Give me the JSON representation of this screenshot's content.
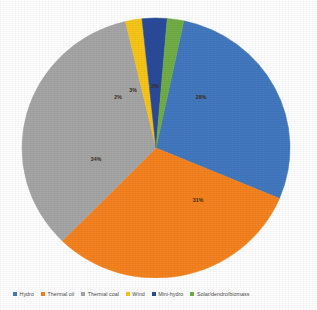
{
  "chart_data": {
    "type": "pie",
    "title": "",
    "categories": [
      "Hydro",
      "Thermal oil",
      "Thermal coal",
      "Wind",
      "Mini-hydro",
      "Solar/dendro/biomass"
    ],
    "values": [
      28,
      31,
      34,
      2,
      3,
      2
    ],
    "value_labels": [
      "28%",
      "31%",
      "34%",
      "2%",
      "3%",
      "2%"
    ],
    "colors": [
      "#4178be",
      "#f4821f",
      "#a5a5a5",
      "#f6c518",
      "#2a4b9b",
      "#71ad47"
    ],
    "legend_position": "bottom",
    "grid": false,
    "start_angle_deg": 12,
    "direction": "clockwise",
    "labels_inside": true
  },
  "legend": {
    "items": [
      {
        "label": "Hydro",
        "color": "#4178be"
      },
      {
        "label": "Thermal oil",
        "color": "#f4821f"
      },
      {
        "label": "Thermal coal",
        "color": "#a5a5a5"
      },
      {
        "label": "Wind",
        "color": "#f6c518"
      },
      {
        "label": "Mini-hydro",
        "color": "#2a4b9b"
      },
      {
        "label": "Solar/dendro/biomass",
        "color": "#71ad47"
      }
    ]
  },
  "slices": [
    {
      "name": "hydro",
      "label": "28%",
      "color": "#4178be",
      "lx": 201,
      "ly": 92
    },
    {
      "name": "thermal-oil",
      "label": "31%",
      "color": "#f4821f",
      "lx": 198,
      "ly": 195
    },
    {
      "name": "thermal-coal",
      "label": "34%",
      "color": "#a5a5a5",
      "lx": 96,
      "ly": 154
    },
    {
      "name": "wind",
      "label": "2%",
      "color": "#f6c518",
      "lx": 118,
      "ly": 92
    },
    {
      "name": "mini-hydro",
      "label": "3%",
      "color": "#2a4b9b",
      "lx": 133,
      "ly": 85
    },
    {
      "name": "solar-dendro-biomass",
      "label": "2%",
      "color": "#71ad47",
      "lx": 155,
      "ly": 81
    }
  ]
}
